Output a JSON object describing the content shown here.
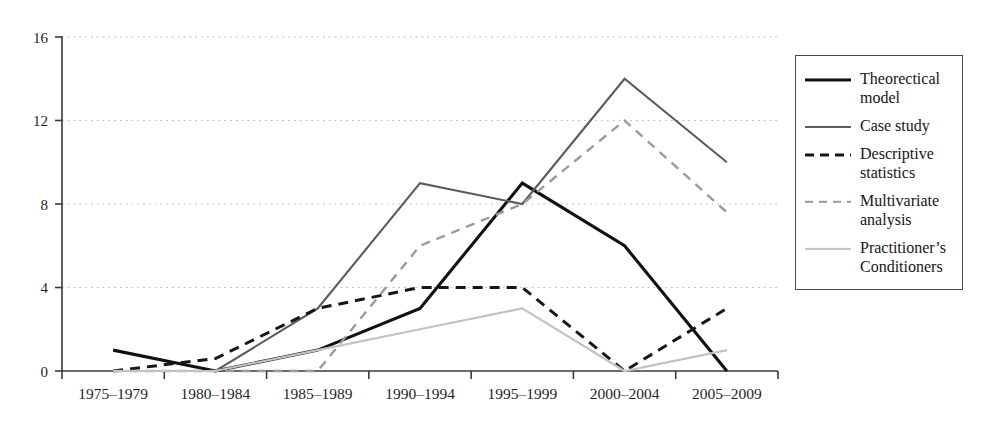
{
  "chart_data": {
    "type": "line",
    "title": "",
    "xlabel": "",
    "ylabel": "",
    "categories": [
      "1975–1979",
      "1980–1984",
      "1985–1989",
      "1990–1994",
      "1995–1999",
      "2000–2004",
      "2005–2009"
    ],
    "ylim": [
      0,
      16
    ],
    "yticks": [
      0,
      4,
      8,
      12,
      16
    ],
    "ytick_labels": [
      "0",
      "4",
      "8",
      "12",
      "16"
    ],
    "grid": "horizontal-dotted",
    "legend_position": "right",
    "series": [
      {
        "name": "Theorectical model",
        "label": "Theorectical\nmodel",
        "style": "solid",
        "color": "#111111",
        "width": 3.1,
        "values": [
          1,
          0,
          1,
          3,
          9,
          6,
          0
        ]
      },
      {
        "name": "Case study",
        "label": "Case study",
        "style": "solid",
        "color": "#5b5b5b",
        "width": 2.1,
        "values": [
          0,
          0,
          3,
          9,
          8,
          14,
          10
        ]
      },
      {
        "name": "Descriptive statistics",
        "label": "Descriptive\nstatistics",
        "style": "dashed",
        "color": "#161616",
        "width": 3.0,
        "values": [
          0,
          0.6,
          3,
          4,
          4,
          0,
          3
        ]
      },
      {
        "name": "Multivariate analysis",
        "label": "Multivariate\nanalysis",
        "style": "dashed",
        "color": "#9a9a9a",
        "width": 2.4,
        "values": [
          0,
          0,
          0,
          6,
          8,
          12,
          7.6
        ]
      },
      {
        "name": "Practitioner's Conditioners",
        "label": "Practitioner’s\nConditioners",
        "style": "solid",
        "color": "#c2c2c2",
        "width": 2.2,
        "values": [
          0,
          0,
          1,
          2,
          3,
          0,
          1
        ]
      }
    ]
  },
  "axes": {
    "y_max_label": "16",
    "y_12_label": "12",
    "y_8_label": "8",
    "y_4_label": "4",
    "y_0_label": "0",
    "x_labels": [
      "1975–1979",
      "1980–1984",
      "1985–1989",
      "1990–1994",
      "1995–1999",
      "2000–2004",
      "2005–2009"
    ]
  },
  "legend": {
    "items": [
      {
        "label": "Theorectical\nmodel"
      },
      {
        "label": "Case study"
      },
      {
        "label": "Descriptive\nstatistics"
      },
      {
        "label": "Multivariate\nanalysis"
      },
      {
        "label": "Practitioner’s\nConditioners"
      }
    ]
  }
}
